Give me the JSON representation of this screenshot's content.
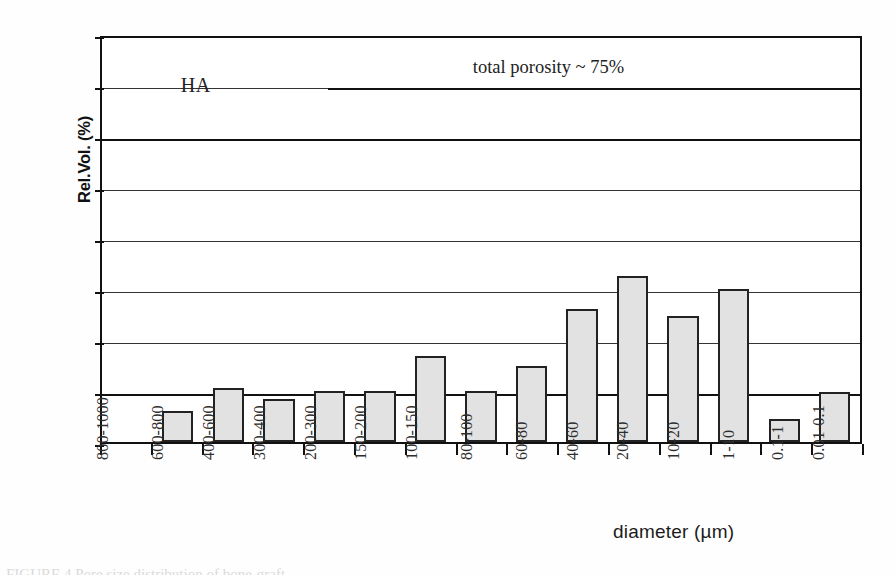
{
  "chart_data": {
    "type": "bar",
    "title": "",
    "xlabel": "diameter (µm)",
    "ylabel": "Rel.Vol. (%)",
    "ylim": [
      0,
      40
    ],
    "ytick_values": [
      0,
      5,
      10,
      15,
      20,
      25,
      30,
      35,
      40
    ],
    "ytick_labels": [
      "0",
      "5",
      "10",
      "15",
      "20",
      "25",
      "30",
      "35",
      "40"
    ],
    "grid": "horizontal",
    "legend": "none",
    "bar_fill_color": "#e2e2e2",
    "bar_edge_color": "#222222",
    "categories": [
      "800-1000",
      "600-800",
      "400-600",
      "300-400",
      "200-300",
      "150-200",
      "100-150",
      "80-100",
      "60-80",
      "40-60",
      "20-40",
      "10-20",
      "1-10",
      "0.1-1",
      "0.01-0.1"
    ],
    "values": [
      0,
      3.0,
      5.3,
      4.2,
      5.0,
      5.0,
      8.4,
      5.0,
      7.5,
      13.0,
      16.3,
      12.4,
      15.0,
      2.3,
      4.9
    ],
    "annotations": [
      {
        "name": "sample-label",
        "text": "HA",
        "x_category": "400-600",
        "y_value": 35.0
      },
      {
        "name": "porosity-label",
        "text": "total porosity ~ 75%",
        "y_value": 36.8
      },
      {
        "name": "porosity-rule",
        "text": "",
        "y_value": 35.0
      }
    ]
  },
  "axes": {
    "y_title": "Rel.Vol. (%)",
    "x_title": "diameter (µm)"
  },
  "caption": {
    "text": "FIGURE 4   Pore size distribution of bone-graft"
  }
}
